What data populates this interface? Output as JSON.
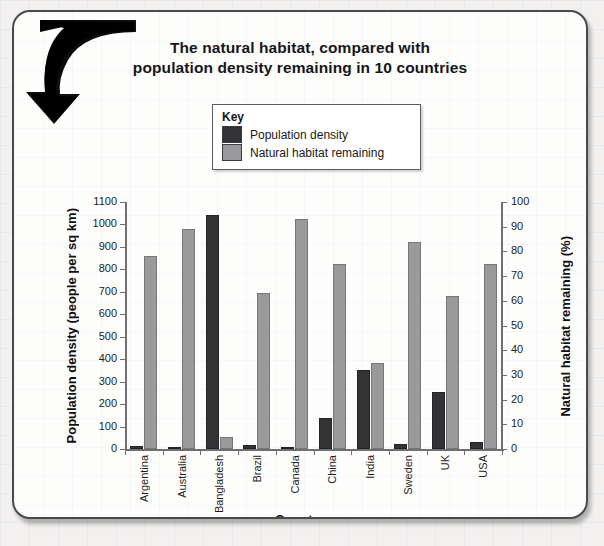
{
  "card": {
    "title_line1": "The natural habitat, compared with",
    "title_line2": "population density remaining in 10 countries",
    "arrow_icon": "curved-down-arrow-icon"
  },
  "legend": {
    "heading": "Key",
    "items": [
      {
        "label": "Population density",
        "color": "#333336"
      },
      {
        "label": "Natural habitat remaining",
        "color": "#9a9a9c"
      }
    ]
  },
  "chart_data": {
    "type": "bar",
    "title": "The natural habitat, compared with population density remaining in 10 countries",
    "xlabel": "Country",
    "ylabel": "Population density (people per sq km)",
    "ylabel_right": "Natural habitat remaining (%)",
    "categories": [
      "Argentina",
      "Australia",
      "Bangladesh",
      "Brazil",
      "Canada",
      "China",
      "India",
      "Sweden",
      "UK",
      "USA"
    ],
    "series": [
      {
        "name": "Population density",
        "axis": "left",
        "units": "people per sq km",
        "color": "#333336",
        "values": [
          15,
          3,
          1040,
          20,
          3,
          140,
          350,
          22,
          255,
          30
        ]
      },
      {
        "name": "Natural habitat remaining",
        "axis": "right",
        "units": "%",
        "color": "#9a9a9c",
        "values": [
          78,
          89,
          5,
          63,
          93,
          75,
          35,
          84,
          62,
          75
        ]
      }
    ],
    "ylim": [
      0,
      1100
    ],
    "ylim_right": [
      0,
      100
    ],
    "yticks": [
      0,
      100,
      200,
      300,
      400,
      500,
      600,
      700,
      800,
      900,
      1000,
      1100
    ],
    "yticks_right": [
      0,
      10,
      20,
      30,
      40,
      50,
      60,
      70,
      80,
      90,
      100
    ],
    "grid": false,
    "legend_position": "top-center"
  }
}
